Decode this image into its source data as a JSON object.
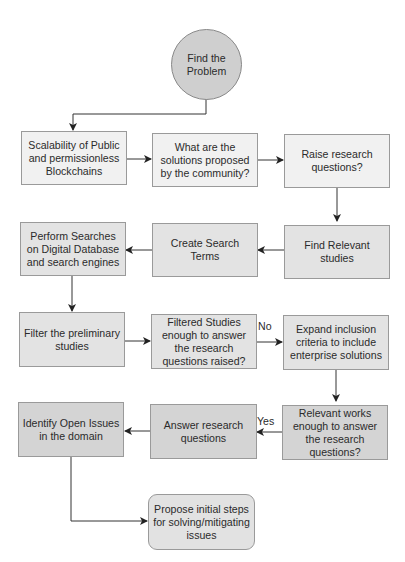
{
  "diagram": {
    "type": "flowchart",
    "nodes": [
      {
        "id": "n0",
        "label": "Find the Problem",
        "shape": "circle"
      },
      {
        "id": "n1",
        "label": "Scalability of Public and permissionless Blockchains",
        "shape": "rect"
      },
      {
        "id": "n2",
        "label": "What are the solutions proposed by the community?",
        "shape": "rect"
      },
      {
        "id": "n3",
        "label": "Raise research questions?",
        "shape": "rect"
      },
      {
        "id": "n4",
        "label": "Find Relevant studies",
        "shape": "rect"
      },
      {
        "id": "n5",
        "label": "Create Search Terms",
        "shape": "rect"
      },
      {
        "id": "n6",
        "label": "Perform Searches on Digital Database and search engines",
        "shape": "rect"
      },
      {
        "id": "n7",
        "label": "Filter the preliminary studies",
        "shape": "rect"
      },
      {
        "id": "n8",
        "label": "Filtered Studies enough to answer the research questions raised?",
        "shape": "rect"
      },
      {
        "id": "n9",
        "label": "Expand inclusion criteria to include enterprise solutions",
        "shape": "rect"
      },
      {
        "id": "n10",
        "label": "Relevant works enough to answer the research questions?",
        "shape": "rect"
      },
      {
        "id": "n11",
        "label": "Answer research questions",
        "shape": "rect"
      },
      {
        "id": "n12",
        "label": "Identify Open Issues in the domain",
        "shape": "rect"
      },
      {
        "id": "n13",
        "label": "Propose initial steps for solving/mitigating issues",
        "shape": "rounded-rect"
      }
    ],
    "edges": [
      {
        "from": "n0",
        "to": "n1",
        "label": ""
      },
      {
        "from": "n1",
        "to": "n2",
        "label": ""
      },
      {
        "from": "n2",
        "to": "n3",
        "label": ""
      },
      {
        "from": "n3",
        "to": "n4",
        "label": ""
      },
      {
        "from": "n4",
        "to": "n5",
        "label": ""
      },
      {
        "from": "n5",
        "to": "n6",
        "label": ""
      },
      {
        "from": "n6",
        "to": "n7",
        "label": ""
      },
      {
        "from": "n7",
        "to": "n8",
        "label": ""
      },
      {
        "from": "n8",
        "to": "n9",
        "label": "No"
      },
      {
        "from": "n9",
        "to": "n10",
        "label": ""
      },
      {
        "from": "n10",
        "to": "n11",
        "label": "Yes"
      },
      {
        "from": "n11",
        "to": "n12",
        "label": ""
      },
      {
        "from": "n12",
        "to": "n13",
        "label": ""
      }
    ],
    "edge_labels": {
      "no": "No",
      "yes": "Yes"
    }
  },
  "colors": {
    "circle_fill": "#cfcfcf",
    "row1_fill": "#f1f1f1",
    "row2_fill": "#e3e3e3",
    "row3_fill": "#e3e3e3",
    "row4_fill": "#d4d4d4",
    "final_fill": "#e2e2e2",
    "stroke": "#9a9a9a",
    "edge": "#333333"
  }
}
